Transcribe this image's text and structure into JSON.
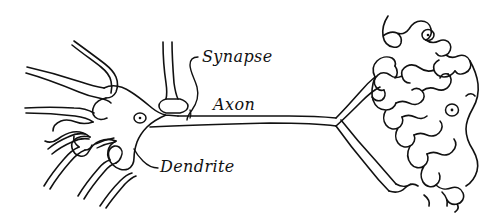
{
  "diagram": {
    "type": "hand-drawn-line-diagram",
    "background_color": "#ffffff",
    "ink_color": "#111111",
    "width": 494,
    "height": 213,
    "labels": [
      {
        "id": "synapse",
        "text": "Synapse",
        "x": 202,
        "y": 62,
        "leader": "curved line from label down-left to bulbous synaptic terminal at soma"
      },
      {
        "id": "axon",
        "text": "Axon",
        "x": 213,
        "y": 110,
        "leader": "none"
      },
      {
        "id": "dendrite",
        "text": "Dendrite",
        "x": 160,
        "y": 172,
        "leader": "short curved line from label up-left to a dendrite branch"
      }
    ],
    "parts": [
      {
        "name": "soma",
        "description": "cell body at left-center with nucleus"
      },
      {
        "name": "nucleus",
        "description": "small circle with dot inside soma"
      },
      {
        "name": "dendrites",
        "description": "branching bulbous processes extending left and down-left"
      },
      {
        "name": "synaptic-terminal",
        "description": "vertical process ending in a bulb contacting the soma from above"
      },
      {
        "name": "axon",
        "description": "long tapering double line running left to right"
      },
      {
        "name": "axon-terminals",
        "description": "lobed arborizations at right end with two nuclei"
      }
    ],
    "nuclei": [
      {
        "id": "soma-nucleus",
        "cx": 140,
        "cy": 118,
        "r": 5
      },
      {
        "id": "terminal-nucleus-upper",
        "cx": 428,
        "cy": 35,
        "r": 5
      },
      {
        "id": "terminal-nucleus-lower",
        "cx": 452,
        "cy": 110,
        "r": 5.5
      }
    ]
  }
}
